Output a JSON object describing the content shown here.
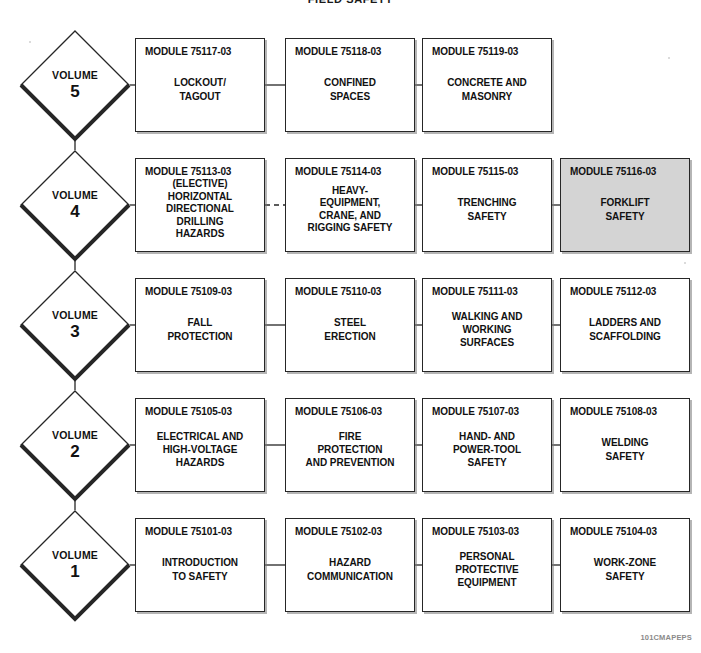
{
  "title": "FIELD SAFETY",
  "footer_code": "101CMAPEPS",
  "colors": {
    "line": "#262626",
    "box_fill": "#ffffff",
    "highlight_fill": "#d4d4d4",
    "text": "#111111",
    "footer_text": "#8a8a8a",
    "background": "#ffffff"
  },
  "rows": [
    {
      "volume_word": "VOLUME",
      "volume_number": "5",
      "modules": [
        {
          "code": "MODULE 75117-03",
          "title": "LOCKOUT/\nTAGOUT",
          "highlighted": false,
          "elective": false
        },
        {
          "code": "MODULE 75118-03",
          "title": "CONFINED\nSPACES",
          "highlighted": false,
          "elective": false
        },
        {
          "code": "MODULE 75119-03",
          "title": "CONCRETE AND\nMASONRY",
          "highlighted": false,
          "elective": false
        }
      ]
    },
    {
      "volume_word": "VOLUME",
      "volume_number": "4",
      "modules": [
        {
          "code": "MODULE 75113-03",
          "title": "(ELECTIVE)\nHORIZONTAL\nDIRECTIONAL\nDRILLING\nHAZARDS",
          "highlighted": false,
          "elective": true
        },
        {
          "code": "MODULE 75114-03",
          "title": "HEAVY-\nEQUIPMENT,\nCRANE, AND\nRIGGING SAFETY",
          "highlighted": false,
          "elective": false
        },
        {
          "code": "MODULE 75115-03",
          "title": "TRENCHING\nSAFETY",
          "highlighted": false,
          "elective": false
        },
        {
          "code": "MODULE 75116-03",
          "title": "FORKLIFT\nSAFETY",
          "highlighted": true,
          "elective": false
        }
      ]
    },
    {
      "volume_word": "VOLUME",
      "volume_number": "3",
      "modules": [
        {
          "code": "MODULE 75109-03",
          "title": "FALL\nPROTECTION",
          "highlighted": false,
          "elective": false
        },
        {
          "code": "MODULE 75110-03",
          "title": "STEEL\nERECTION",
          "highlighted": false,
          "elective": false
        },
        {
          "code": "MODULE 75111-03",
          "title": "WALKING AND\nWORKING\nSURFACES",
          "highlighted": false,
          "elective": false
        },
        {
          "code": "MODULE 75112-03",
          "title": "LADDERS AND\nSCAFFOLDING",
          "highlighted": false,
          "elective": false
        }
      ]
    },
    {
      "volume_word": "VOLUME",
      "volume_number": "2",
      "modules": [
        {
          "code": "MODULE 75105-03",
          "title": "ELECTRICAL AND\nHIGH-VOLTAGE\nHAZARDS",
          "highlighted": false,
          "elective": false
        },
        {
          "code": "MODULE 75106-03",
          "title": "FIRE\nPROTECTION\nAND PREVENTION",
          "highlighted": false,
          "elective": false
        },
        {
          "code": "MODULE 75107-03",
          "title": "HAND- AND\nPOWER-TOOL\nSAFETY",
          "highlighted": false,
          "elective": false
        },
        {
          "code": "MODULE 75108-03",
          "title": "WELDING\nSAFETY",
          "highlighted": false,
          "elective": false
        }
      ]
    },
    {
      "volume_word": "VOLUME",
      "volume_number": "1",
      "modules": [
        {
          "code": "MODULE 75101-03",
          "title": "INTRODUCTION\nTO SAFETY",
          "highlighted": false,
          "elective": false
        },
        {
          "code": "MODULE 75102-03",
          "title": "HAZARD\nCOMMUNICATION",
          "highlighted": false,
          "elective": false
        },
        {
          "code": "MODULE 75103-03",
          "title": "PERSONAL\nPROTECTIVE\nEQUIPMENT",
          "highlighted": false,
          "elective": false
        },
        {
          "code": "MODULE 75104-03",
          "title": "WORK-ZONE\nSAFETY",
          "highlighted": false,
          "elective": false
        }
      ]
    }
  ],
  "layout": {
    "diamond_cx": 75,
    "diamond_half_w": 56,
    "diamond_half_h": 56,
    "row_cy": [
      85,
      205,
      325,
      445,
      565
    ],
    "col_x": [
      135,
      285,
      422,
      560
    ],
    "box_w": 130,
    "box_h": 94
  }
}
